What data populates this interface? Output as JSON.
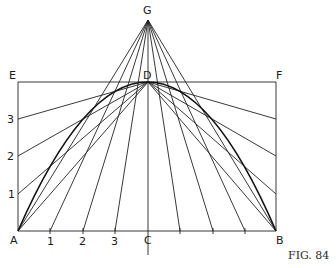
{
  "figure": {
    "caption": "Fig. 84",
    "caption_display": "FIG. 84",
    "points": {
      "G": {
        "label": "G",
        "x": 148,
        "y": 20
      },
      "E": {
        "label": "E",
        "x": 18,
        "y": 82
      },
      "D": {
        "label": "D",
        "x": 148,
        "y": 82
      },
      "F": {
        "label": "F",
        "x": 276,
        "y": 82
      },
      "A": {
        "label": "A",
        "x": 18,
        "y": 231
      },
      "C": {
        "label": "C",
        "x": 148,
        "y": 231
      },
      "B": {
        "label": "B",
        "x": 276,
        "y": 231
      }
    },
    "left_side_marks": [
      {
        "label": "3",
        "y": 119
      },
      {
        "label": "2",
        "y": 156
      },
      {
        "label": "1",
        "y": 194
      }
    ],
    "base_marks": [
      {
        "label": "1",
        "x": 50
      },
      {
        "label": "2",
        "x": 83
      },
      {
        "label": "3",
        "x": 115
      },
      {
        "label": "",
        "x": 180
      },
      {
        "label": "",
        "x": 213
      },
      {
        "label": "",
        "x": 245
      }
    ],
    "labels": {
      "G": "G",
      "E": "E",
      "D": "D",
      "F": "F",
      "A": "A",
      "B": "B",
      "C": "C",
      "side3": "3",
      "side2": "2",
      "side1": "1",
      "base1": "1",
      "base2": "2",
      "base3": "3"
    }
  }
}
